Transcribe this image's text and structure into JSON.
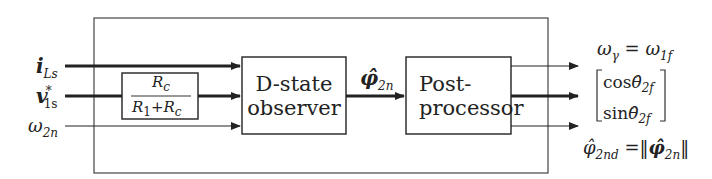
{
  "diagram": {
    "inputs": [
      {
        "id": "i_Ls",
        "symbol": "i",
        "sub": "Ls",
        "bold": true
      },
      {
        "id": "v_1s_star",
        "symbol": "v",
        "sub": "1s",
        "sup": "*",
        "bold": true
      },
      {
        "id": "omega_2n",
        "symbol": "ω",
        "sub": "2n",
        "bold": false
      }
    ],
    "gain_block": {
      "numerator": "Rc",
      "num_sym": "R",
      "num_sub": "c",
      "den_a": "R",
      "den_a_sub": "1",
      "den_plus": "+",
      "den_b": "R",
      "den_b_sub": "c"
    },
    "observer_block": {
      "line1": "D-state",
      "line2": "observer"
    },
    "intermediate_signal": {
      "symbol": "φ̂",
      "sub": "2n"
    },
    "post_block": {
      "line1": "Post-",
      "line2": "processor"
    },
    "outputs": {
      "omega": {
        "lhs": "ω",
        "lhs_sub": "γ",
        "eq": "=",
        "rhs": "ω",
        "rhs_sub": "1f"
      },
      "vector": {
        "row1_fn": "cos",
        "row1_sym": "θ̂",
        "row1_sub": "2f",
        "row2_fn": "sin",
        "row2_sym": "θ̂",
        "row2_sub": "2f"
      },
      "magnitude": {
        "lhs": "φ̂",
        "lhs_sub": "2nd",
        "eq": "=",
        "norm_open": "‖",
        "rhs": "φ̂",
        "rhs_sub": "2n",
        "norm_close": "‖"
      }
    }
  }
}
